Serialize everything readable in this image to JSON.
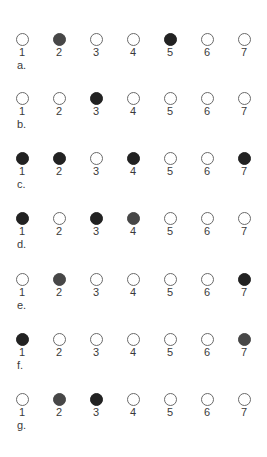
{
  "figure": {
    "rows": [
      {
        "label": "a.",
        "states": [
          "empty",
          "mid",
          "empty",
          "empty",
          "dark",
          "empty",
          "empty"
        ]
      },
      {
        "label": "b.",
        "states": [
          "empty",
          "empty",
          "dark",
          "empty",
          "empty",
          "empty",
          "empty"
        ]
      },
      {
        "label": "c.",
        "states": [
          "dark",
          "dark",
          "empty",
          "dark",
          "empty",
          "empty",
          "dark"
        ]
      },
      {
        "label": "d.",
        "states": [
          "dark",
          "empty",
          "dark",
          "mid",
          "empty",
          "empty",
          "empty"
        ]
      },
      {
        "label": "e.",
        "states": [
          "empty",
          "mid",
          "empty",
          "empty",
          "empty",
          "empty",
          "dark"
        ]
      },
      {
        "label": "f.",
        "states": [
          "dark",
          "empty",
          "empty",
          "empty",
          "empty",
          "empty",
          "mid"
        ]
      },
      {
        "label": "g.",
        "states": [
          "empty",
          "mid",
          "dark",
          "empty",
          "empty",
          "empty",
          "empty"
        ]
      }
    ],
    "numbers": [
      "1",
      "2",
      "3",
      "4",
      "5",
      "6",
      "7"
    ],
    "colors": {
      "dark": "#222222",
      "mid": "#474747",
      "empty": "#ffffff",
      "outline": "#6a6a6a"
    }
  }
}
